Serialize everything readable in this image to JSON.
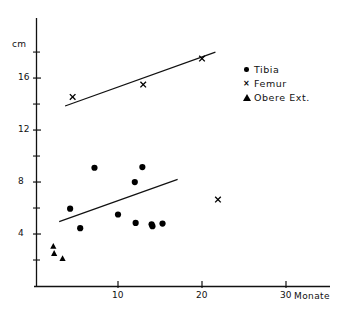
{
  "chart_data": {
    "type": "scatter",
    "title": "",
    "xlabel": "Monate",
    "ylabel": "cm",
    "xlim": [
      0,
      33
    ],
    "ylim": [
      0,
      19
    ],
    "grid": false,
    "legend_position": "top-right",
    "x_ticks": [
      10,
      20,
      30
    ],
    "x_tick_labels": [
      "10",
      "20",
      "30"
    ],
    "y_ticks": [
      4,
      8,
      12,
      16
    ],
    "y_tick_labels": [
      "4",
      "8",
      "12",
      "16"
    ],
    "y_minor_ticks": [
      2,
      6,
      10,
      14,
      18
    ],
    "series": [
      {
        "name": "Tibia",
        "marker": "filled-circle",
        "color": "#000000",
        "points": [
          {
            "x": 4.3,
            "y": 5.95
          },
          {
            "x": 5.5,
            "y": 4.45
          },
          {
            "x": 7.2,
            "y": 9.1
          },
          {
            "x": 10.0,
            "y": 5.5
          },
          {
            "x": 12.0,
            "y": 8.0
          },
          {
            "x": 12.1,
            "y": 4.85
          },
          {
            "x": 12.9,
            "y": 9.15
          },
          {
            "x": 14.0,
            "y": 4.75
          },
          {
            "x": 14.1,
            "y": 4.6
          },
          {
            "x": 15.3,
            "y": 4.8
          }
        ]
      },
      {
        "name": "Femur",
        "marker": "x",
        "color": "#000000",
        "points": [
          {
            "x": 4.6,
            "y": 14.55
          },
          {
            "x": 13.0,
            "y": 15.5
          },
          {
            "x": 20.0,
            "y": 17.5
          },
          {
            "x": 21.9,
            "y": 6.65
          }
        ]
      },
      {
        "name": "Obere Ext.",
        "marker": "filled-triangle",
        "color": "#000000",
        "points": [
          {
            "x": 2.3,
            "y": 3.05
          },
          {
            "x": 2.4,
            "y": 2.5
          },
          {
            "x": 3.4,
            "y": 2.1
          }
        ]
      }
    ],
    "trend_lines": [
      {
        "name": "Femur-trend",
        "x1": 3.7,
        "y1": 13.85,
        "x2": 21.6,
        "y2": 18.0
      },
      {
        "name": "Tibia-trend",
        "x1": 3.0,
        "y1": 4.95,
        "x2": 17.1,
        "y2": 8.2
      }
    ]
  },
  "legend": {
    "items": [
      {
        "label": "Tibia",
        "marker": "filled-circle"
      },
      {
        "label": "Femur",
        "marker": "x"
      },
      {
        "label": "Obere Ext.",
        "marker": "filled-triangle"
      }
    ]
  },
  "axes": {
    "y_unit_label": "cm",
    "x_unit_label": "Monate"
  }
}
